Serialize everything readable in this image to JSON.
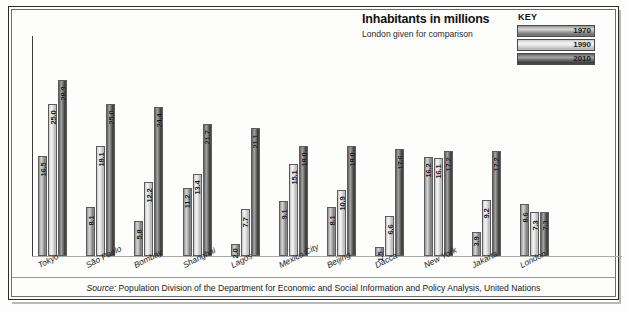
{
  "chart_data": {
    "type": "bar",
    "title": "Inhabitants in millions",
    "subtitle": "London given for comparison",
    "xlabel": "",
    "ylabel": "Inhabitants in millions",
    "ylim": [
      0,
      30
    ],
    "grid": false,
    "legend_position": "top-right",
    "legend_title": "KEY",
    "categories": [
      "Tokyo",
      "São Paolo",
      "Bombay",
      "Shanghai",
      "Lagos",
      "Mexico City",
      "Beijing",
      "Dacca",
      "New York",
      "Jakarta",
      "London"
    ],
    "series": [
      {
        "name": "1970",
        "color": "#a9a9a9",
        "values": [
          16.5,
          8.1,
          5.8,
          11.2,
          2.0,
          9.1,
          8.1,
          1.5,
          16.2,
          3.9,
          8.6
        ]
      },
      {
        "name": "1990",
        "color": "#dcdcdc",
        "values": [
          25.0,
          18.1,
          12.2,
          13.4,
          7.7,
          15.1,
          10.9,
          6.6,
          16.1,
          9.2,
          7.3
        ]
      },
      {
        "name": "2010",
        "color": "#5c5c5c",
        "values": [
          28.9,
          25.0,
          24.4,
          21.7,
          21.1,
          18.0,
          18.0,
          17.6,
          17.2,
          17.2,
          7.3
        ]
      }
    ],
    "source_label": "Source:",
    "source_text": "Population Division of the Department for Economic and Social Information and Policy Analysis, United Nations"
  },
  "title_block": {
    "title": "Inhabitants in millions",
    "subtitle": "London given for comparison"
  },
  "legend": {
    "title": "KEY",
    "items": [
      {
        "label": "1970"
      },
      {
        "label": "1990"
      },
      {
        "label": "2010"
      }
    ]
  },
  "source": {
    "label": "Source:",
    "text": "Population Division of the Department for Economic and Social Information and Policy Analysis, United Nations"
  }
}
